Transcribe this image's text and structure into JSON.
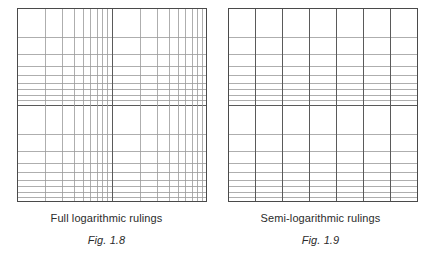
{
  "page": {
    "background_color": "#ffffff",
    "width": 427,
    "height": 257
  },
  "style": {
    "line_color": "#5a5a5a",
    "line_color_light": "#9a9a9a",
    "border_color": "#4a4a4a",
    "text_color": "#2b2b2b"
  },
  "figures": [
    {
      "id": "fig-1-8",
      "title": "Full logarithmic rulings",
      "fig_label": "Fig. 1.8",
      "ruling_type": "log-log",
      "x_axis": {
        "scale": "logarithmic",
        "decades": 2,
        "minor_divisions": [
          1,
          2,
          3,
          4,
          5,
          6,
          7,
          8,
          9
        ]
      },
      "y_axis": {
        "scale": "logarithmic",
        "decades": 2,
        "minor_divisions": [
          1,
          2,
          3,
          4,
          5,
          6,
          7,
          8,
          9
        ]
      }
    },
    {
      "id": "fig-1-9",
      "title": "Semi-logarithmic rulings",
      "fig_label": "Fig. 1.9",
      "ruling_type": "semi-log",
      "x_axis": {
        "scale": "linear",
        "divisions": 7
      },
      "y_axis": {
        "scale": "logarithmic",
        "decades": 2,
        "minor_divisions": [
          1,
          2,
          3,
          4,
          5,
          6,
          7,
          8,
          9
        ]
      }
    }
  ],
  "chart_data": {
    "type": "table",
    "panels": [
      {
        "name": "Full logarithmic rulings",
        "caption": "Fig. 1.8",
        "x_scale": "log",
        "y_scale": "log",
        "x_decades": 2,
        "y_decades": 2,
        "decade_fractions": [
          0,
          0.30103,
          0.47712,
          0.60206,
          0.69897,
          0.77815,
          0.8451,
          0.90309,
          0.95424,
          1.0
        ]
      },
      {
        "name": "Semi-logarithmic rulings",
        "caption": "Fig. 1.9",
        "x_scale": "linear",
        "y_scale": "log",
        "x_divisions": 7,
        "y_decades": 2,
        "decade_fractions": [
          0,
          0.30103,
          0.47712,
          0.60206,
          0.69897,
          0.77815,
          0.8451,
          0.90309,
          0.95424,
          1.0
        ]
      }
    ]
  }
}
